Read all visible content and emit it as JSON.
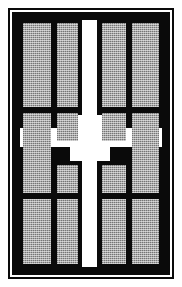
{
  "figure": {
    "orientation": "portrait",
    "width_px": 182,
    "height_px": 287
  },
  "style": {
    "wall_color": "#0a0a0a",
    "room_fill_color": "#a8a8a8",
    "corridor_color": "#ffffff",
    "background_color": "#ffffff",
    "room_fill_pattern": "stippled-halftone",
    "outer_rule_width_px": 2,
    "wall_frame_width_px": 8
  },
  "frame": {
    "outer_rule_label": "outer border rule",
    "gap_label": "white separation gap",
    "wall_label": "perimeter wall"
  },
  "corridors": {
    "vertical": {
      "label": "central vertical corridor",
      "axis": "north-south",
      "x_px": 62,
      "width_px": 15,
      "top_px": 0,
      "height_px": 247
    },
    "horizontal": {
      "label": "central horizontal corridor",
      "axis": "east-west",
      "y_px": 108,
      "height_px": 19,
      "left_px": 0,
      "width_px": 142
    },
    "node": {
      "label": "central crossing node",
      "x_px": 50,
      "y_px": 95,
      "width_px": 40,
      "height_px": 46
    }
  },
  "rooms": [
    {
      "id": "R1",
      "label": "room 1",
      "row": 1,
      "col": 1,
      "x": 3,
      "y": 3,
      "w": 28,
      "h": 84
    },
    {
      "id": "R2",
      "label": "room 2",
      "row": 1,
      "col": 2,
      "x": 37,
      "y": 3,
      "w": 21,
      "h": 84
    },
    {
      "id": "R3",
      "label": "room 3",
      "row": 1,
      "col": 3,
      "x": 82,
      "y": 3,
      "w": 24,
      "h": 84
    },
    {
      "id": "R4",
      "label": "room 4",
      "row": 1,
      "col": 4,
      "x": 112,
      "y": 3,
      "w": 27,
      "h": 84
    },
    {
      "id": "R5",
      "label": "room 5",
      "row": 2,
      "col": 1,
      "x": 3,
      "y": 93,
      "w": 28,
      "h": 42
    },
    {
      "id": "R6",
      "label": "room 6",
      "row": 2,
      "col": 2,
      "x": 37,
      "y": 93,
      "w": 21,
      "h": 28
    },
    {
      "id": "R7",
      "label": "room 7",
      "row": 2,
      "col": 3,
      "x": 82,
      "y": 93,
      "w": 24,
      "h": 28
    },
    {
      "id": "R8",
      "label": "room 8",
      "row": 2,
      "col": 4,
      "x": 112,
      "y": 93,
      "w": 27,
      "h": 42
    },
    {
      "id": "R9",
      "label": "room 9",
      "row": 3,
      "col": 1,
      "x": 3,
      "y": 131,
      "w": 28,
      "h": 42
    },
    {
      "id": "R10",
      "label": "room 10",
      "row": 3,
      "col": 2,
      "x": 37,
      "y": 145,
      "w": 21,
      "h": 28
    },
    {
      "id": "R11",
      "label": "room 11",
      "row": 3,
      "col": 3,
      "x": 82,
      "y": 145,
      "w": 24,
      "h": 28
    },
    {
      "id": "R12",
      "label": "room 12",
      "row": 3,
      "col": 4,
      "x": 112,
      "y": 131,
      "w": 27,
      "h": 42
    },
    {
      "id": "R13",
      "label": "room 13",
      "row": 4,
      "col": 1,
      "x": 3,
      "y": 179,
      "w": 28,
      "h": 65
    },
    {
      "id": "R14",
      "label": "room 14",
      "row": 4,
      "col": 2,
      "x": 37,
      "y": 179,
      "w": 21,
      "h": 65
    },
    {
      "id": "R15",
      "label": "room 15",
      "row": 4,
      "col": 3,
      "x": 82,
      "y": 179,
      "w": 24,
      "h": 65
    },
    {
      "id": "R16",
      "label": "room 16",
      "row": 4,
      "col": 4,
      "x": 112,
      "y": 179,
      "w": 27,
      "h": 65
    }
  ],
  "counts": {
    "total_rooms": 16,
    "rows": 4,
    "columns": 4,
    "corridor_count": 2
  }
}
